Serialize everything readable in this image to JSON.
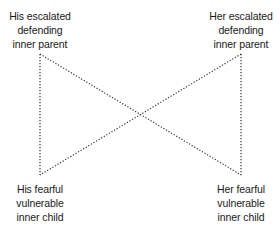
{
  "diagram": {
    "type": "bowtie-cycle",
    "line_style": "dotted",
    "line_color": "#333333",
    "nodes": {
      "his_parent": {
        "position": "top-left",
        "lines": [
          "His escalated",
          "defending",
          "inner parent"
        ]
      },
      "her_parent": {
        "position": "top-right",
        "lines": [
          "Her escalated",
          "defending",
          "inner parent"
        ]
      },
      "his_child": {
        "position": "bottom-left",
        "lines": [
          "His fearful",
          "vulnerable",
          "inner child"
        ]
      },
      "her_child": {
        "position": "bottom-right",
        "lines": [
          "Her fearful",
          "vulnerable",
          "inner child"
        ]
      }
    },
    "connections": [
      {
        "from": "his_parent",
        "to": "his_child"
      },
      {
        "from": "her_parent",
        "to": "her_child"
      },
      {
        "from": "his_parent",
        "to": "her_child"
      },
      {
        "from": "her_parent",
        "to": "his_child"
      }
    ]
  }
}
